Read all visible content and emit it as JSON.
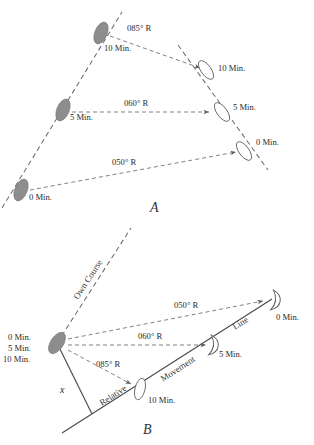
{
  "figure": {
    "caption_top_faint": "",
    "panels": [
      {
        "id": "A",
        "letter": "A",
        "description": "True motion plot: own ship and target ship true positions at 0, 5 and 10 minutes with bearing lines",
        "bearing_labels": [
          {
            "key": "b085",
            "text": "085° R"
          },
          {
            "key": "b060",
            "text": "060° R"
          },
          {
            "key": "b050",
            "text": "050° R"
          }
        ],
        "own_ship_time_labels": [
          {
            "key": "own10",
            "text": "10 Min."
          },
          {
            "key": "own5",
            "text": "5 Min."
          },
          {
            "key": "own0",
            "text": "0 Min."
          }
        ],
        "target_time_labels": [
          {
            "key": "tgt10",
            "text": "10 Min."
          },
          {
            "key": "tgt5",
            "text": "5 Min."
          },
          {
            "key": "tgt0",
            "text": "0 Min."
          }
        ]
      },
      {
        "id": "B",
        "letter": "B",
        "description": "Relative motion plot: own ship fixed at origin, target relative positions along relative movement line",
        "own_course_label": "Own Course",
        "relative_label_words": [
          {
            "key": "rel",
            "text": "Relative"
          },
          {
            "key": "mov",
            "text": "Movement"
          },
          {
            "key": "line",
            "text": "Line"
          }
        ],
        "angle_label": "x",
        "own_ship_time_labels": [
          {
            "key": "own0",
            "text": "0 Min."
          },
          {
            "key": "own5",
            "text": "5 Min."
          },
          {
            "key": "own10",
            "text": "10 Min."
          }
        ],
        "bearing_labels": [
          {
            "key": "b050",
            "text": "050° R"
          },
          {
            "key": "b060",
            "text": "060° R"
          },
          {
            "key": "b085",
            "text": "085° R"
          }
        ],
        "target_time_labels": [
          {
            "key": "tgt0",
            "text": "0 Min."
          },
          {
            "key": "tgt5",
            "text": "5 Min."
          },
          {
            "key": "tgt10",
            "text": "10 Min."
          }
        ]
      }
    ],
    "colors": {
      "dashed_line": "#6d6d6d",
      "solid_line": "#4a4a4a",
      "own_ship_fill": "#8d8d8d",
      "target_ship_fill": "#ffffff",
      "text": "#2a2a2a",
      "background": "#ffffff"
    }
  }
}
